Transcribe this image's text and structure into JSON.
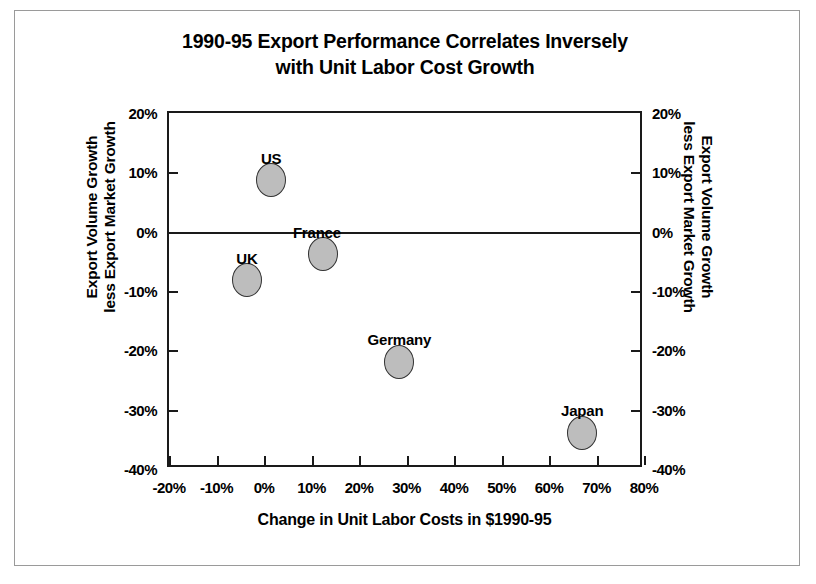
{
  "chart_data": {
    "type": "scatter",
    "title": "1990-95 Export Performance Correlates Inversely with Unit Labor Cost Growth",
    "title_lines": [
      "1990-95 Export Performance Correlates Inversely",
      "with Unit Labor Cost Growth"
    ],
    "xlabel": "Change in Unit Labor Costs in $1990-95",
    "ylabel": "Export Volume Growth less Export Market Growth",
    "ylabel_lines": [
      "Export Volume Growth",
      "less Export Market Growth"
    ],
    "ylabel_right_lines": [
      "Export Volume Growth",
      "less Export Market Growth"
    ],
    "xlim": [
      -20,
      80
    ],
    "ylim": [
      -40,
      20
    ],
    "xticks": [
      -20,
      -10,
      0,
      10,
      20,
      30,
      40,
      50,
      60,
      70,
      80
    ],
    "xtick_labels": [
      "-20%",
      "-10%",
      "0%",
      "10%",
      "20%",
      "30%",
      "40%",
      "50%",
      "60%",
      "70%",
      "80%"
    ],
    "yticks": [
      20,
      10,
      0,
      -10,
      -20,
      -30,
      -40
    ],
    "ytick_labels": [
      "20%",
      "10%",
      "0%",
      "-10%",
      "-20%",
      "-30%",
      "-40%"
    ],
    "ytick_labels_right": [
      "20%",
      "10%",
      "0%",
      "-10%",
      "-20%",
      "-30%",
      "-40%"
    ],
    "grid": false,
    "legend": "none",
    "zero_line": 0,
    "points": [
      {
        "label": "US",
        "x": 1.5,
        "y": 8.7,
        "label_dx": 0,
        "label_dy": -30
      },
      {
        "label": "France",
        "x": 12.4,
        "y": -3.8,
        "label_dx": -6,
        "label_dy": -30
      },
      {
        "label": "UK",
        "x": -3.6,
        "y": -8.2,
        "label_dx": 0,
        "label_dy": -30
      },
      {
        "label": "Germany",
        "x": 28.5,
        "y": -22.0,
        "label_dx": 0,
        "label_dy": -31
      },
      {
        "label": "Japan",
        "x": 67.0,
        "y": -34.0,
        "label_dx": 0,
        "label_dy": -31
      }
    ],
    "marker_fill": "#bdbdbd",
    "marker_edge": "#333333",
    "axis_color": "#1a1a1a",
    "background": "#ffffff"
  }
}
